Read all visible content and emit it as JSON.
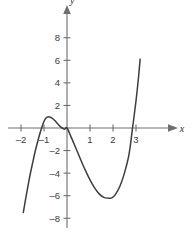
{
  "chart_data": {
    "type": "line",
    "title": "",
    "subtitle": "",
    "xlabel": "x",
    "ylabel": "y",
    "xlim": [
      -2.15,
      3.5
    ],
    "ylim": [
      -9.2,
      9.6
    ],
    "grid": false,
    "legend": null,
    "axis_style": "arrows-both-ends",
    "x_ticks": [
      -2,
      -1,
      1,
      2,
      3
    ],
    "x_tick_labels": [
      "–2",
      "–1",
      "1",
      "2",
      "3"
    ],
    "y_ticks": [
      8,
      6,
      4,
      2,
      -2,
      -4,
      -6,
      -8
    ],
    "y_tick_labels": [
      "8",
      "6",
      "4",
      "2",
      "–2",
      "–4",
      "–6",
      "–8"
    ],
    "origin_label": "",
    "series": [
      {
        "name": "cubic",
        "color": "#3d3d3d",
        "equation": "y = x^3 - 1.3x^2 - 4.3x",
        "roots": [
          -1.5,
          0,
          2.85
        ],
        "local_maximum": {
          "x": -0.82,
          "y": 1.0
        },
        "local_minimum": {
          "x": 1.95,
          "y": -6.2
        },
        "x_start": -1.9,
        "y_start": -7.5,
        "x_end": 3.18,
        "y_end": 6.1,
        "points": [
          {
            "x": -1.9,
            "y": -7.5
          },
          {
            "x": -1.8,
            "y": -6.3
          },
          {
            "x": -1.7,
            "y": -5.17
          },
          {
            "x": -1.6,
            "y": -4.1
          },
          {
            "x": -1.5,
            "y": -3.15
          },
          {
            "x": -1.4,
            "y": -2.22
          },
          {
            "x": -1.3,
            "y": -1.4
          },
          {
            "x": -1.2,
            "y": -0.65
          },
          {
            "x": -1.1,
            "y": 0.02
          },
          {
            "x": -1.0,
            "y": 0.6
          },
          {
            "x": -0.9,
            "y": 0.9
          },
          {
            "x": -0.82,
            "y": 1.0
          },
          {
            "x": -0.7,
            "y": 0.93
          },
          {
            "x": -0.6,
            "y": 0.8
          },
          {
            "x": -0.5,
            "y": 0.6
          },
          {
            "x": -0.4,
            "y": 0.35
          },
          {
            "x": -0.3,
            "y": 0.15
          },
          {
            "x": -0.2,
            "y": 0.0
          },
          {
            "x": -0.1,
            "y": -0.1
          },
          {
            "x": 0.0,
            "y": 0.0
          },
          {
            "x": 0.2,
            "y": -0.9
          },
          {
            "x": 0.4,
            "y": -1.86
          },
          {
            "x": 0.6,
            "y": -2.83
          },
          {
            "x": 0.8,
            "y": -3.76
          },
          {
            "x": 1.0,
            "y": -4.6
          },
          {
            "x": 1.2,
            "y": -5.31
          },
          {
            "x": 1.4,
            "y": -5.84
          },
          {
            "x": 1.6,
            "y": -6.15
          },
          {
            "x": 1.8,
            "y": -6.22
          },
          {
            "x": 1.95,
            "y": -6.2
          },
          {
            "x": 2.1,
            "y": -5.91
          },
          {
            "x": 2.3,
            "y": -5.17
          },
          {
            "x": 2.5,
            "y": -3.98
          },
          {
            "x": 2.7,
            "y": -2.29
          },
          {
            "x": 2.85,
            "y": 0.0
          },
          {
            "x": 3.0,
            "y": 2.4
          },
          {
            "x": 3.1,
            "y": 4.3
          },
          {
            "x": 3.18,
            "y": 6.1
          }
        ]
      }
    ]
  },
  "axes": {
    "x_axis_name": "x",
    "y_axis_name": "y"
  }
}
